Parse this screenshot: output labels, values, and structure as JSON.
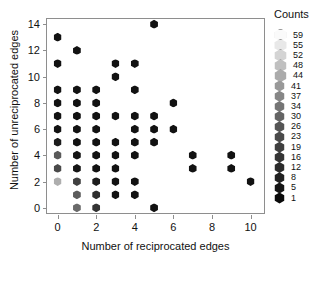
{
  "chart_data": {
    "type": "scatter",
    "title": "",
    "xlabel": "Number of reciprocated edges",
    "ylabel": "Number of unreciprocated edges",
    "xlim": [
      -0.55,
      10.8
    ],
    "ylim": [
      -0.55,
      14.4
    ],
    "xticks": [
      0,
      2,
      4,
      6,
      8,
      10
    ],
    "yticks": [
      0,
      2,
      4,
      6,
      8,
      10,
      12,
      14
    ],
    "grid": false,
    "marker": "hexagon",
    "legend": {
      "title": "Counts",
      "position": "right",
      "entries": [
        {
          "label": "59",
          "color": "#fafafa"
        },
        {
          "label": "55",
          "color": "#e8e8e8"
        },
        {
          "label": "52",
          "color": "#d4d4d4"
        },
        {
          "label": "48",
          "color": "#c0c0c0"
        },
        {
          "label": "44",
          "color": "#ababab"
        },
        {
          "label": "41",
          "color": "#999999"
        },
        {
          "label": "37",
          "color": "#868686"
        },
        {
          "label": "34",
          "color": "#757575"
        },
        {
          "label": "30",
          "color": "#646464"
        },
        {
          "label": "26",
          "color": "#555555"
        },
        {
          "label": "23",
          "color": "#4a4a4a"
        },
        {
          "label": "19",
          "color": "#3f3f3f"
        },
        {
          "label": "16",
          "color": "#353535"
        },
        {
          "label": "12",
          "color": "#2b2b2b"
        },
        {
          "label": "8",
          "color": "#212121"
        },
        {
          "label": "5",
          "color": "#151515"
        },
        {
          "label": "1",
          "color": "#0a0a0a"
        }
      ]
    },
    "points": [
      {
        "x": 0,
        "y": 13,
        "color": "#121212"
      },
      {
        "x": 0,
        "y": 11,
        "color": "#121212"
      },
      {
        "x": 0,
        "y": 9,
        "color": "#121212"
      },
      {
        "x": 0,
        "y": 8,
        "color": "#121212"
      },
      {
        "x": 0,
        "y": 7,
        "color": "#121212"
      },
      {
        "x": 0,
        "y": 6,
        "color": "#121212"
      },
      {
        "x": 0,
        "y": 5,
        "color": "#1c1c1c"
      },
      {
        "x": 0,
        "y": 4,
        "color": "#5a5a5a"
      },
      {
        "x": 0,
        "y": 3,
        "color": "#4a4a4a"
      },
      {
        "x": 0,
        "y": 2,
        "color": "#aeaeae"
      },
      {
        "x": 1,
        "y": 12,
        "color": "#121212"
      },
      {
        "x": 1,
        "y": 9,
        "color": "#121212"
      },
      {
        "x": 1,
        "y": 8,
        "color": "#121212"
      },
      {
        "x": 1,
        "y": 7,
        "color": "#121212"
      },
      {
        "x": 1,
        "y": 6,
        "color": "#121212"
      },
      {
        "x": 1,
        "y": 5,
        "color": "#121212"
      },
      {
        "x": 1,
        "y": 4,
        "color": "#151515"
      },
      {
        "x": 1,
        "y": 3,
        "color": "#151515"
      },
      {
        "x": 1,
        "y": 2,
        "color": "#404040"
      },
      {
        "x": 1,
        "y": 1,
        "color": "#5c5c5c"
      },
      {
        "x": 1,
        "y": 0,
        "color": "#6a6a6a"
      },
      {
        "x": 2,
        "y": 9,
        "color": "#121212"
      },
      {
        "x": 2,
        "y": 8,
        "color": "#121212"
      },
      {
        "x": 2,
        "y": 7,
        "color": "#121212"
      },
      {
        "x": 2,
        "y": 6,
        "color": "#121212"
      },
      {
        "x": 2,
        "y": 5,
        "color": "#121212"
      },
      {
        "x": 2,
        "y": 4,
        "color": "#121212"
      },
      {
        "x": 2,
        "y": 3,
        "color": "#121212"
      },
      {
        "x": 2,
        "y": 2,
        "color": "#1c1c1c"
      },
      {
        "x": 2,
        "y": 1,
        "color": "#2e2e2e"
      },
      {
        "x": 2,
        "y": 0,
        "color": "#343434"
      },
      {
        "x": 3,
        "y": 11,
        "color": "#121212"
      },
      {
        "x": 3,
        "y": 10,
        "color": "#121212"
      },
      {
        "x": 3,
        "y": 7,
        "color": "#121212"
      },
      {
        "x": 3,
        "y": 5,
        "color": "#121212"
      },
      {
        "x": 3,
        "y": 4,
        "color": "#121212"
      },
      {
        "x": 3,
        "y": 3,
        "color": "#121212"
      },
      {
        "x": 3,
        "y": 2,
        "color": "#121212"
      },
      {
        "x": 3,
        "y": 1,
        "color": "#121212"
      },
      {
        "x": 4,
        "y": 11,
        "color": "#121212"
      },
      {
        "x": 4,
        "y": 9,
        "color": "#121212"
      },
      {
        "x": 4,
        "y": 7,
        "color": "#121212"
      },
      {
        "x": 4,
        "y": 6,
        "color": "#121212"
      },
      {
        "x": 4,
        "y": 5,
        "color": "#121212"
      },
      {
        "x": 4,
        "y": 4,
        "color": "#121212"
      },
      {
        "x": 4,
        "y": 2,
        "color": "#121212"
      },
      {
        "x": 4,
        "y": 1,
        "color": "#121212"
      },
      {
        "x": 5,
        "y": 14,
        "color": "#121212"
      },
      {
        "x": 5,
        "y": 7,
        "color": "#121212"
      },
      {
        "x": 5,
        "y": 6,
        "color": "#121212"
      },
      {
        "x": 5,
        "y": 5,
        "color": "#121212"
      },
      {
        "x": 5,
        "y": 0,
        "color": "#121212"
      },
      {
        "x": 6,
        "y": 8,
        "color": "#121212"
      },
      {
        "x": 6,
        "y": 6,
        "color": "#121212"
      },
      {
        "x": 7,
        "y": 4,
        "color": "#121212"
      },
      {
        "x": 7,
        "y": 3,
        "color": "#121212"
      },
      {
        "x": 9,
        "y": 4,
        "color": "#121212"
      },
      {
        "x": 9,
        "y": 3,
        "color": "#121212"
      },
      {
        "x": 10,
        "y": 2,
        "color": "#121212"
      }
    ]
  }
}
